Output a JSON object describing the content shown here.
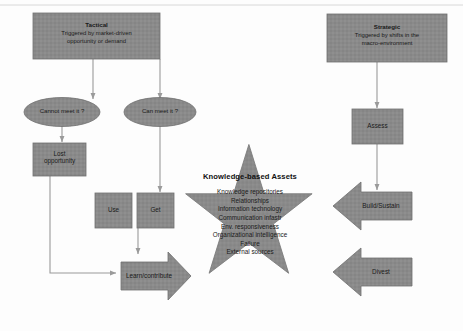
{
  "diagram": {
    "colors": {
      "shape_fill": "#8a8a8a",
      "shape_stroke": "#6f6f6f",
      "star_fill": "#898989",
      "connector": "#9a9a9a",
      "text": "#1a1a1a",
      "background": "#fdfdfd"
    },
    "tactical": {
      "title": "Tactical",
      "subtitle_line1": "Triggered by market-driven",
      "subtitle_line2": "opportunity or demand"
    },
    "strategic": {
      "title": "Strategic",
      "subtitle_line1": "Triggered by shifts in the",
      "subtitle_line2": "macro-environment"
    },
    "decisions": {
      "cannot_meet": "Cannot meet it ?",
      "can_meet": "Can meet it ?"
    },
    "outcomes": {
      "lost_opportunity_line1": "Lost",
      "lost_opportunity_line2": "opportunity",
      "use": "Use",
      "get": "Get",
      "learn_contribute": "Learn/contribute",
      "assess": "Assess",
      "build_sustain": "Build/Sustain",
      "divest": "Divest"
    },
    "star": {
      "heading": "Knowledge-based Assets",
      "items": [
        "Knowledge repositories",
        "Relationships",
        "Information technology",
        "Communication infastr",
        "Env. responsiveness",
        "Organizational intelligence",
        "Failure",
        "External sources"
      ]
    }
  }
}
